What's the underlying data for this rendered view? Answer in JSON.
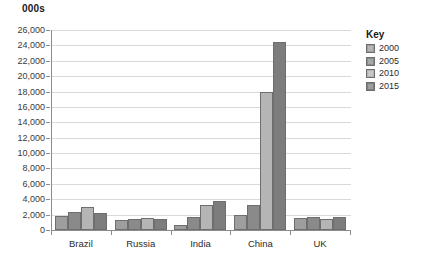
{
  "chart_data": {
    "type": "bar",
    "title": "",
    "unit_label": "000s",
    "xlabel": "",
    "ylabel": "",
    "ylim": [
      0,
      26000
    ],
    "ytick_step": 2000,
    "grid": true,
    "legend_position": "right",
    "legend_title": "Key",
    "categories": [
      "Brazil",
      "Russia",
      "India",
      "China",
      "UK"
    ],
    "ytick_labels": [
      "26,000",
      "24,000",
      "22,000",
      "20,000",
      "18,000",
      "16,000",
      "14,000",
      "12,000",
      "10,000",
      "8,000",
      "6,000",
      "4,000",
      "2,000",
      "0"
    ],
    "series": [
      {
        "name": "2000",
        "color": "#9e9e9e",
        "values": [
          1800,
          1300,
          700,
          2000,
          1600
        ]
      },
      {
        "name": "2005",
        "color": "#8a8a8a",
        "values": [
          2400,
          1400,
          1700,
          3200,
          1700
        ]
      },
      {
        "name": "2010",
        "color": "#b5b5b5",
        "values": [
          3000,
          1500,
          3200,
          18000,
          1400
        ]
      },
      {
        "name": "2015",
        "color": "#7d7d7d",
        "values": [
          2200,
          1400,
          3800,
          24500,
          1700
        ]
      }
    ]
  }
}
